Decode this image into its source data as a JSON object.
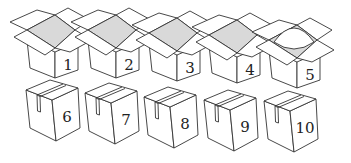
{
  "figure": {
    "colors": {
      "line": "#333333",
      "inner_fill": "#d9d9d9",
      "background": "#ffffff"
    },
    "open_boxes": [
      {
        "label": "1",
        "x": 0,
        "y": 0,
        "content": "empty"
      },
      {
        "label": "2",
        "x": 61,
        "y": 0,
        "content": "empty"
      },
      {
        "label": "3",
        "x": 122,
        "y": 3,
        "content": "empty"
      },
      {
        "label": "4",
        "x": 182,
        "y": 5,
        "content": "empty"
      },
      {
        "label": "5",
        "x": 242,
        "y": 10,
        "content": "ball"
      }
    ],
    "closed_boxes": [
      {
        "label": "6",
        "x": 0,
        "y": 0
      },
      {
        "label": "7",
        "x": 59,
        "y": 3
      },
      {
        "label": "8",
        "x": 118,
        "y": 7
      },
      {
        "label": "9",
        "x": 178,
        "y": 10
      },
      {
        "label": "10",
        "x": 238,
        "y": 11
      }
    ]
  }
}
